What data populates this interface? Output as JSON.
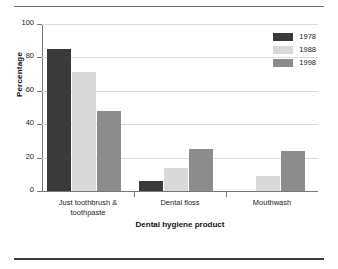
{
  "chart_data": {
    "type": "bar",
    "title": "",
    "xlabel": "Dental hygiene product",
    "ylabel": "Percentage",
    "ylim": [
      0,
      100
    ],
    "yticks": [
      0,
      20,
      40,
      60,
      80,
      100
    ],
    "grid": true,
    "legend_position": "top-right",
    "categories": [
      "Just toothbrush &\ntoothpaste",
      "Dental floss",
      "Mouthwash"
    ],
    "series": [
      {
        "name": "1978",
        "color": "#3a3a3a",
        "values": [
          85,
          6,
          0
        ]
      },
      {
        "name": "1988",
        "color": "#d9d9d9",
        "values": [
          71,
          14,
          9
        ]
      },
      {
        "name": "1998",
        "color": "#8c8c8c",
        "values": [
          48,
          25,
          24
        ]
      }
    ]
  },
  "axes": {
    "y_tick_labels": [
      "0",
      "20",
      "40",
      "60",
      "80",
      "100"
    ],
    "y_title": "Percentage",
    "x_title": "Dental hygiene product",
    "x_tick_labels": [
      "Just toothbrush &\ntoothpaste",
      "Dental floss",
      "Mouthwash"
    ]
  },
  "legend": {
    "entries": [
      {
        "label": "1978",
        "color": "#3a3a3a"
      },
      {
        "label": "1988",
        "color": "#d9d9d9"
      },
      {
        "label": "1998",
        "color": "#8c8c8c"
      }
    ]
  }
}
